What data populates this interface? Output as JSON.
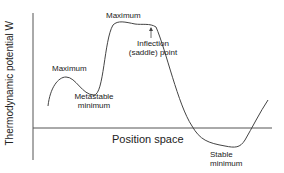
{
  "axes": {
    "y_label": "Thermodynamic potential W",
    "x_label": "Position space"
  },
  "annotations": {
    "maximum_left": "Maximum",
    "maximum_top": "Maximum",
    "inflection_line1": "Inflection",
    "inflection_line2": "(saddle) point",
    "metastable_line1": "Metastable",
    "metastable_line2": "minimum",
    "stable_line1": "Stable",
    "stable_line2": "minimum"
  },
  "colors": {
    "line": "#444444",
    "text": "#222222"
  }
}
